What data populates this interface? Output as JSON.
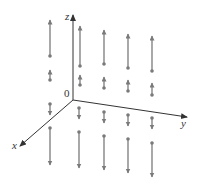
{
  "diagram": {
    "type": "3d-vector-field",
    "colors": {
      "axis": "#333333",
      "vector": "#7a7a7a",
      "background": "#ffffff"
    },
    "axes": {
      "origin": {
        "x": 73,
        "y": 100,
        "label": "0"
      },
      "x": {
        "label": "x",
        "end": {
          "x": 20,
          "y": 146
        },
        "label_pos": {
          "x": 12,
          "y": 149
        }
      },
      "y": {
        "label": "y",
        "end": {
          "x": 187,
          "y": 117
        },
        "label_pos": {
          "x": 181,
          "y": 127
        }
      },
      "z": {
        "label": "z",
        "end": {
          "x": 73,
          "y": 15
        },
        "label_pos": {
          "x": 65,
          "y": 20
        }
      }
    },
    "vectors": [
      {
        "column": 1,
        "x": 50,
        "dot_y": 56,
        "tip_y": 20,
        "direction": "up"
      },
      {
        "column": 1,
        "x": 50,
        "dot_y": 80,
        "tip_y": 70,
        "direction": "up"
      },
      {
        "column": 1,
        "x": 50,
        "dot_y": 104,
        "tip_y": 115,
        "direction": "down"
      },
      {
        "column": 1,
        "x": 50,
        "dot_y": 128,
        "tip_y": 165,
        "direction": "down"
      },
      {
        "column": 2,
        "x": 80,
        "dot_y": 66,
        "tip_y": 26,
        "direction": "up"
      },
      {
        "column": 2,
        "x": 80,
        "dot_y": 85,
        "tip_y": 75,
        "direction": "up"
      },
      {
        "column": 2,
        "x": 79,
        "dot_y": 108,
        "tip_y": 119,
        "direction": "down"
      },
      {
        "column": 2,
        "x": 79,
        "dot_y": 132,
        "tip_y": 168,
        "direction": "down"
      },
      {
        "column": 3,
        "x": 104,
        "dot_y": 64,
        "tip_y": 30,
        "direction": "up"
      },
      {
        "column": 3,
        "x": 104,
        "dot_y": 88,
        "tip_y": 77,
        "direction": "up"
      },
      {
        "column": 3,
        "x": 104,
        "dot_y": 112,
        "tip_y": 123,
        "direction": "down"
      },
      {
        "column": 3,
        "x": 104,
        "dot_y": 136,
        "tip_y": 170,
        "direction": "down"
      },
      {
        "column": 4,
        "x": 128,
        "dot_y": 68,
        "tip_y": 34,
        "direction": "up"
      },
      {
        "column": 4,
        "x": 128,
        "dot_y": 91,
        "tip_y": 80,
        "direction": "up"
      },
      {
        "column": 4,
        "x": 128,
        "dot_y": 115,
        "tip_y": 126,
        "direction": "down"
      },
      {
        "column": 4,
        "x": 128,
        "dot_y": 139,
        "tip_y": 173,
        "direction": "down"
      },
      {
        "column": 5,
        "x": 152,
        "dot_y": 71,
        "tip_y": 36,
        "direction": "up"
      },
      {
        "column": 5,
        "x": 152,
        "dot_y": 95,
        "tip_y": 83,
        "direction": "up"
      },
      {
        "column": 5,
        "x": 152,
        "dot_y": 118,
        "tip_y": 129,
        "direction": "down"
      },
      {
        "column": 5,
        "x": 152,
        "dot_y": 143,
        "tip_y": 177,
        "direction": "down"
      }
    ]
  }
}
